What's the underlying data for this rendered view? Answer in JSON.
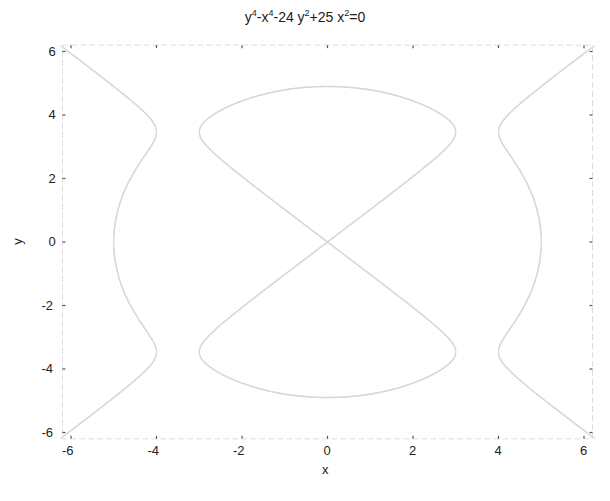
{
  "chart_data": {
    "type": "line",
    "title_parts": {
      "t1": "y",
      "s1": "4",
      "t2": "-x",
      "s2": "4",
      "t3": "-24 y",
      "s3": "2",
      "t4": "+25 x",
      "s4": "2",
      "t5": "=0"
    },
    "xlabel": "x",
    "ylabel": "y",
    "xlim": [
      -6.2,
      6.2
    ],
    "ylim": [
      -6.2,
      6.2
    ],
    "xticks": [
      "-6",
      "-4",
      "-2",
      "0",
      "2",
      "4",
      "6"
    ],
    "yticks": [
      "6",
      "4",
      "2",
      "0",
      "-2",
      "-4",
      "-6"
    ],
    "grid": false,
    "legend": null,
    "equation": "y^4 - x^4 - 24*y^2 + 25*x^2 = 0",
    "curve_color": "#d8d8d8",
    "axis_color": "#dddddd",
    "series": [
      {
        "name": "implicit curve (inner figure-eight lobes)",
        "description": "Two lobes crossing at origin, extending to y=±~4.9 at x=0, max width x≈±3 at y≈±3.5",
        "points": [
          [
            0,
            0
          ],
          [
            1,
            1.02
          ],
          [
            2,
            2.1
          ],
          [
            3,
            3.5
          ],
          [
            2,
            4.6
          ],
          [
            0,
            4.9
          ],
          [
            -2,
            4.6
          ],
          [
            -3,
            3.5
          ],
          [
            -2,
            2.1
          ],
          [
            -1,
            1.02
          ],
          [
            0,
            0
          ],
          [
            1,
            -1.02
          ],
          [
            2,
            -2.1
          ],
          [
            3,
            -3.5
          ],
          [
            2,
            -4.6
          ],
          [
            0,
            -4.9
          ],
          [
            -2,
            -4.6
          ],
          [
            -3,
            -3.5
          ],
          [
            -2,
            -2.1
          ],
          [
            -1,
            -1.02
          ]
        ]
      },
      {
        "name": "implicit curve (outer side branches)",
        "description": "Left and right branches passing through x=±5 at y=0, pinching at x≈±4 near y=±3.5, extending to corners (±6,±6)",
        "points": [
          [
            5,
            0
          ],
          [
            4.7,
            2
          ],
          [
            4,
            3.5
          ],
          [
            4.7,
            4.6
          ],
          [
            6,
            6
          ],
          [
            4.7,
            -4.6
          ],
          [
            4,
            -3.5
          ],
          [
            4.7,
            -2
          ],
          [
            -5,
            0
          ],
          [
            -4.7,
            2
          ],
          [
            -4,
            3.5
          ],
          [
            -4.7,
            4.6
          ],
          [
            -6,
            6
          ],
          [
            -4.7,
            -4.6
          ],
          [
            -4,
            -3.5
          ],
          [
            -4.7,
            -2
          ]
        ]
      }
    ]
  }
}
